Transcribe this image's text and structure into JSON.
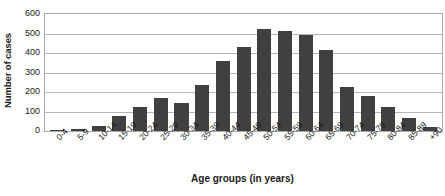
{
  "chart_data": {
    "type": "bar",
    "title": "",
    "xlabel": "Age groups (in years)",
    "ylabel": "Number of cases",
    "categories": [
      "0-4",
      "5-9",
      "10-14",
      "15-19",
      "20-24",
      "25-29",
      "30-34",
      "35-39",
      "40-44",
      "45-49",
      "50-54",
      "55-59",
      "60-64",
      "65-69",
      "70-74",
      "75-79",
      "80-84",
      "85-89",
      "90+"
    ],
    "values": [
      5,
      12,
      25,
      75,
      125,
      170,
      145,
      235,
      360,
      430,
      525,
      515,
      490,
      415,
      225,
      180,
      125,
      65,
      20
    ],
    "ylim": [
      0,
      600
    ],
    "yticks": [
      0,
      100,
      200,
      300,
      400,
      500,
      600
    ],
    "ytick_labels": [
      "0",
      "100",
      "200",
      "300",
      "400",
      "500",
      "600"
    ],
    "grid": true,
    "legend": "none",
    "bar_color": "#404040",
    "gridline_color": "#b6b6b6",
    "axis_border_color": "#aaaaaa"
  }
}
